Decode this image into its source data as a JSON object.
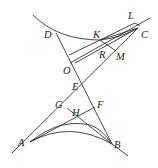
{
  "diagram": {
    "type": "geometric-construction",
    "points": {
      "A": {
        "label": "A",
        "x": 30,
        "y": 142,
        "lx": 18,
        "ly": 144
      },
      "B": {
        "label": "B",
        "x": 112,
        "y": 144,
        "lx": 114,
        "ly": 144
      },
      "C": {
        "label": "C",
        "x": 138,
        "y": 28,
        "lx": 141,
        "ly": 38
      },
      "D": {
        "label": "D",
        "x": 56,
        "y": 33,
        "lx": 45,
        "ly": 38
      },
      "E": {
        "label": "E",
        "x": 82,
        "y": 84,
        "lx": 72,
        "ly": 89
      },
      "F": {
        "label": "F",
        "x": 95,
        "y": 107,
        "lx": 98,
        "ly": 107
      },
      "G": {
        "label": "G",
        "x": 67,
        "y": 108,
        "lx": 55,
        "ly": 107
      },
      "H": {
        "label": "H",
        "x": 79,
        "y": 117,
        "lx": 72,
        "ly": 116
      },
      "K": {
        "label": "K",
        "x": 100,
        "y": 40,
        "lx": 94,
        "ly": 38
      },
      "L": {
        "label": "L",
        "x": 135,
        "y": 23,
        "lx": 128,
        "ly": 19
      },
      "M": {
        "label": "M",
        "x": 116,
        "y": 51,
        "lx": 117,
        "ly": 60
      },
      "O": {
        "label": "O",
        "x": 75,
        "y": 63,
        "lx": 64,
        "ly": 73
      },
      "R": {
        "label": "R",
        "x": 106,
        "y": 47,
        "lx": 100,
        "ly": 57
      }
    },
    "labels": [
      "A",
      "B",
      "C",
      "D",
      "E",
      "F",
      "G",
      "H",
      "K",
      "L",
      "M",
      "O",
      "R"
    ]
  }
}
